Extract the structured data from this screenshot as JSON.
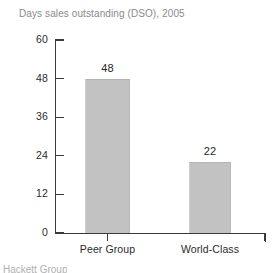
{
  "chart_data": {
    "type": "bar",
    "title": "Days sales outstanding (DSO), 2005",
    "xlabel": "",
    "ylabel": "",
    "categories": [
      "Peer Group",
      "World-Class"
    ],
    "values": [
      48,
      22
    ],
    "data_labels": [
      "48",
      "22"
    ],
    "ylim": [
      0,
      60
    ],
    "yticks": [
      0,
      12,
      24,
      36,
      48,
      60
    ],
    "ytick_labels": [
      "0",
      "12",
      "24",
      "36",
      "48",
      "60"
    ],
    "grid": false,
    "legend": false,
    "legend_position": "none",
    "bar_color": "#c2c2c2",
    "axis_color": "#3a3a3a",
    "title_color": "#8a8a8a",
    "label_color": "#2b2b2b"
  },
  "footer": {
    "source_note": "Hackett Group"
  }
}
